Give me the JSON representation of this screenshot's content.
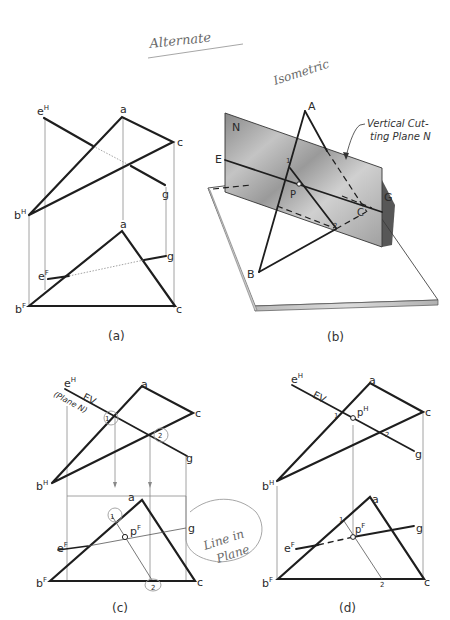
{
  "annotations": {
    "alternate": "Alternate",
    "isometric": "Isometric"
  },
  "panel_a": {
    "caption": "(a)",
    "top_view": {
      "eH": "e",
      "eH_sup": "H",
      "a": "a",
      "c": "c",
      "g": "g",
      "bH": "b",
      "bH_sup": "H"
    },
    "front_view": {
      "a": "a",
      "eF": "e",
      "eF_sup": "F",
      "g": "g",
      "bF": "b",
      "bF_sup": "F",
      "c": "c"
    }
  },
  "panel_b": {
    "caption": "(b)",
    "labels": {
      "N": "N",
      "A": "A",
      "E": "E",
      "P": "P",
      "G": "G",
      "C": "C",
      "B": "B",
      "pt1": "1",
      "pt2": "2"
    },
    "callout_line1": "Vertical Cut-",
    "callout_line2": "ting Plane N",
    "colors": {
      "plane": "#9e9e9e",
      "plate_edge": "#c8c8c8"
    }
  },
  "panel_c": {
    "caption": "(c)",
    "top_view": {
      "eH": "e",
      "eH_sup": "H",
      "ev": "EV",
      "plane_note": "(Plane N)",
      "a": "a",
      "c": "c",
      "g": "g",
      "bH": "b",
      "bH_sup": "H",
      "pt1": "1",
      "pt2": "2"
    },
    "front_view": {
      "a": "a",
      "pt1": "1",
      "pF": "p",
      "pF_sup": "F",
      "g": "g",
      "eF": "e",
      "eF_sup": "F",
      "bF": "b",
      "bF_sup": "F",
      "c": "c",
      "pt2": "2"
    },
    "handnote_line1": "Line in",
    "handnote_line2": "Plane"
  },
  "panel_d": {
    "caption": "(d)",
    "top_view": {
      "eH": "e",
      "eH_sup": "H",
      "ev": "EV",
      "pt1": "1",
      "pH": "p",
      "pH_sup": "H",
      "a": "a",
      "c": "c",
      "pt2": "2",
      "g": "g",
      "bH": "b",
      "bH_sup": "H"
    },
    "front_view": {
      "a": "a",
      "pt1": "1",
      "pF": "p",
      "pF_sup": "F",
      "g": "g",
      "eF": "e",
      "eF_sup": "F",
      "bF": "b",
      "bF_sup": "F",
      "c": "c",
      "pt2": "2"
    }
  }
}
